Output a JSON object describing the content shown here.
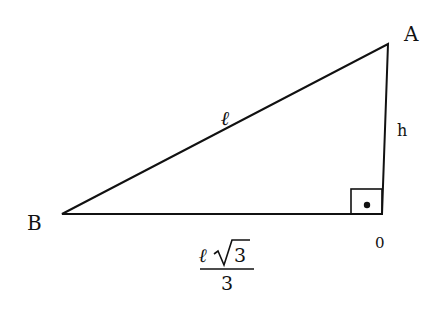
{
  "diagram": {
    "type": "right-triangle",
    "vertices": {
      "A": {
        "label": "A"
      },
      "B": {
        "label": "B"
      },
      "O": {
        "label": "0"
      }
    },
    "sides": {
      "hypotenuse": {
        "label": "ℓ"
      },
      "height": {
        "label": "h"
      },
      "base": {
        "numerator": "ℓ√3",
        "numerator_letter": "ℓ",
        "numerator_radicand": "3",
        "denominator": "3"
      }
    },
    "right_angle_marker": "square-with-dot",
    "colors": {
      "stroke": "#111111",
      "background": "#ffffff"
    }
  }
}
